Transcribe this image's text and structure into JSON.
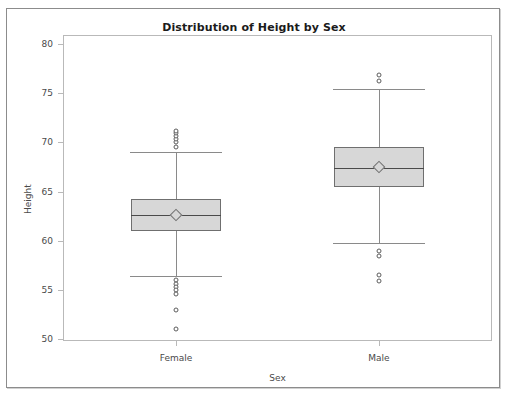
{
  "chart_data": {
    "type": "boxplot",
    "title": "Distribution of Height by Sex",
    "xlabel": "Sex",
    "ylabel": "Height",
    "categories": [
      "Female",
      "Male"
    ],
    "ylim": [
      50,
      80
    ],
    "ytick_values": [
      50,
      55,
      60,
      65,
      70,
      75,
      80
    ],
    "ytick_labels": [
      "50",
      "55",
      "60",
      "65",
      "70",
      "75",
      "80"
    ],
    "grid": false,
    "legend": null,
    "box_fill_color": "#d7d7d7",
    "box_edge_color": "#6f6f6f",
    "whisker_color": "#8a8a8a",
    "outlier_marker": "open-circle",
    "mean_marker": "open-diamond",
    "boxes": [
      {
        "category": "Female",
        "whisker_low": 56.4,
        "q1": 61.0,
        "median": 62.6,
        "mean": 62.6,
        "q3": 64.2,
        "whisker_high": 69.0,
        "outliers_high": [
          69.5,
          70.0,
          70.3,
          70.6,
          70.9,
          71.2
        ],
        "outliers_low": [
          56.0,
          55.6,
          55.3,
          55.0,
          54.6,
          53.0,
          51.0
        ]
      },
      {
        "category": "Male",
        "whisker_low": 59.8,
        "q1": 65.5,
        "median": 67.4,
        "mean": 67.5,
        "q3": 69.5,
        "whisker_high": 75.4,
        "outliers_high": [
          76.8,
          76.2
        ],
        "outliers_low": [
          59.0,
          58.4,
          56.5,
          55.9
        ]
      }
    ]
  }
}
